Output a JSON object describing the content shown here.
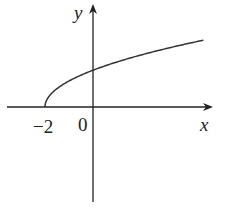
{
  "chart_data": {
    "type": "line",
    "title": "",
    "function": "y = sqrt(x + 2)",
    "xlabel": "x",
    "ylabel": "y",
    "tick_labels": {
      "x": [
        "−2",
        "0"
      ]
    },
    "x_start": -2,
    "xlim": [
      -3.8,
      5.2
    ],
    "ylim": [
      -3.5,
      3.5
    ],
    "grid": false,
    "legend": null,
    "series": [
      {
        "name": "sqrt(x+2)",
        "x": [
          -2,
          -1.9,
          -1.5,
          -1,
          -0.5,
          0,
          1,
          2,
          3,
          4,
          4.6
        ],
        "y": [
          0,
          0.32,
          0.71,
          1.0,
          1.22,
          1.41,
          1.73,
          2.0,
          2.24,
          2.45,
          2.57
        ]
      }
    ]
  },
  "labels": {
    "x_axis": "x",
    "y_axis": "y",
    "tick_neg2": "−2",
    "origin": "0"
  },
  "colors": {
    "axis": "#222222",
    "curve": "#333333"
  }
}
